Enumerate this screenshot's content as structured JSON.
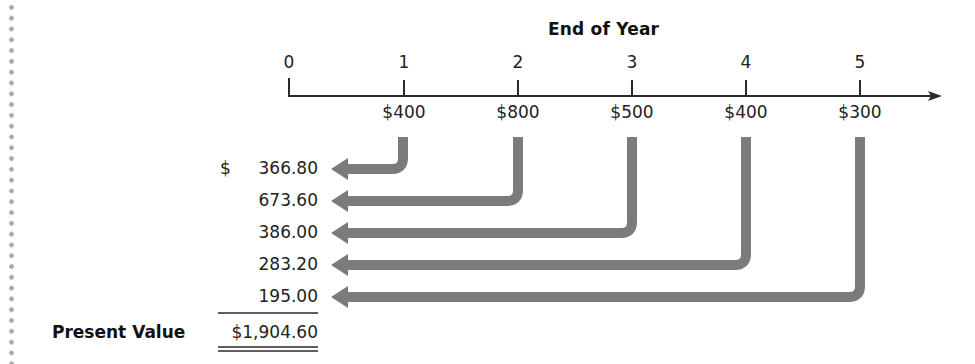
{
  "diagram": {
    "title": "End of Year",
    "timeline": {
      "years": [
        "0",
        "1",
        "2",
        "3",
        "4",
        "5"
      ],
      "cash_flows": [
        {
          "year": "1",
          "amount": "$400"
        },
        {
          "year": "2",
          "amount": "$800"
        },
        {
          "year": "3",
          "amount": "$500"
        },
        {
          "year": "4",
          "amount": "$400"
        },
        {
          "year": "5",
          "amount": "$300"
        }
      ]
    },
    "present_values": {
      "currency_symbol": "$",
      "values": [
        "366.80",
        "673.60",
        "386.00",
        "283.20",
        "195.00"
      ]
    },
    "total": {
      "label": "Present Value",
      "value": "$1,904.60"
    },
    "colors": {
      "axis": "#2a2a2a",
      "arrow": "#7b7b7b",
      "text": "#1a1a1a",
      "margin_dots": "#a9a9a9"
    }
  }
}
